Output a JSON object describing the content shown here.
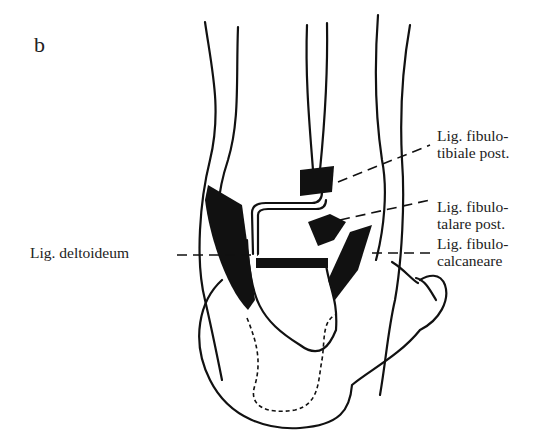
{
  "figure": {
    "panel_letter": "b",
    "labels": {
      "deltoid": {
        "text": "Lig. deltoideum"
      },
      "fibulotibiale_post": {
        "line1": "Lig. fibulo-",
        "line2": "tibiale post."
      },
      "fibulotalare_post": {
        "line1": "Lig. fibulo-",
        "line2": "talare post."
      },
      "fibulocalcaneare": {
        "line1": "Lig. fibulo-",
        "line2": "calcaneare"
      }
    },
    "colors": {
      "ink": "#111111",
      "background": "#ffffff",
      "text": "#222222"
    }
  }
}
